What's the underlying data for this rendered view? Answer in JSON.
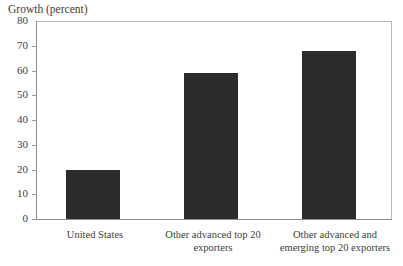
{
  "chart_data": {
    "type": "bar",
    "title": "Growth (percent)",
    "xlabel": "",
    "ylabel": "",
    "categories": [
      "United States",
      "Other advanced top 20 exporters",
      "Other advanced and emerging top 20 exporters"
    ],
    "values": [
      20,
      59,
      68
    ],
    "ylim": [
      0,
      80
    ],
    "yticks": [
      0,
      10,
      20,
      30,
      40,
      50,
      60,
      70,
      80
    ],
    "ytick_labels": [
      "0",
      "10",
      "20",
      "30",
      "40",
      "50",
      "60",
      "70",
      "80"
    ],
    "grid": false,
    "legend": null,
    "bar_color": "#2b2b2b",
    "frame_color": "#b9b9b9",
    "axis_color": "#8d8d8d",
    "background": "#ffffff"
  },
  "axis": {
    "tick_0": "0",
    "tick_10": "10",
    "tick_20": "20",
    "tick_30": "30",
    "tick_40": "40",
    "tick_50": "50",
    "tick_60": "60",
    "tick_70": "70",
    "tick_80": "80"
  },
  "categories": {
    "cat_0": "United States",
    "cat_1": "Other advanced top 20 exporters",
    "cat_2": "Other advanced and emerging top 20 exporters"
  }
}
